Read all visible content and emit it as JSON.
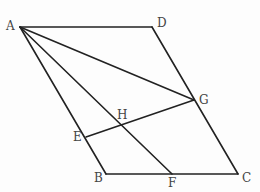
{
  "figure": {
    "type": "parallelogram-construction",
    "stroke_color": "#222222",
    "label_color": "#444444",
    "points": {
      "A": {
        "label": "A",
        "x": 20,
        "y": 27
      },
      "B": {
        "label": "B",
        "x": 106,
        "y": 174
      },
      "C": {
        "label": "C",
        "x": 238,
        "y": 174
      },
      "D": {
        "label": "D",
        "x": 152,
        "y": 27
      },
      "E": {
        "label": "E",
        "x": 86,
        "y": 137
      },
      "F": {
        "label": "F",
        "x": 172,
        "y": 174
      },
      "G": {
        "label": "G",
        "x": 194,
        "y": 100
      },
      "H": {
        "label": "H",
        "x": 122,
        "y": 124
      }
    },
    "segments": [
      [
        "A",
        "D"
      ],
      [
        "D",
        "C"
      ],
      [
        "C",
        "B"
      ],
      [
        "B",
        "A"
      ],
      [
        "A",
        "G"
      ],
      [
        "A",
        "F"
      ],
      [
        "E",
        "G"
      ]
    ],
    "labels": {
      "A": "A",
      "B": "B",
      "C": "C",
      "D": "D",
      "E": "E",
      "F": "F",
      "G": "G",
      "H": "H"
    }
  }
}
